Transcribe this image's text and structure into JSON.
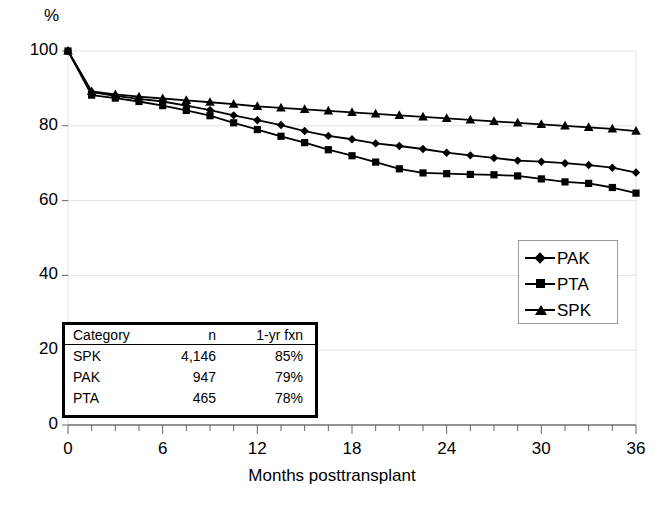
{
  "chart_data": {
    "type": "line",
    "title": "",
    "xlabel": "Months posttransplant",
    "ylabel": "%",
    "ylim": [
      0,
      100
    ],
    "xlim": [
      0,
      36
    ],
    "yticks": [
      0,
      20,
      40,
      60,
      80,
      100
    ],
    "xticks": [
      0,
      6,
      12,
      18,
      24,
      30,
      36
    ],
    "grid": "horizontal",
    "legend_position": "right-middle",
    "x": [
      0,
      1.5,
      3,
      4.5,
      6,
      7.5,
      9,
      10.5,
      12,
      13.5,
      15,
      16.5,
      18,
      19.5,
      21,
      22.5,
      24,
      25.5,
      27,
      28.5,
      30,
      31.5,
      33,
      34.5,
      36
    ],
    "series": [
      {
        "name": "PAK",
        "marker": "diamond",
        "values": [
          100,
          89,
          88,
          87.2,
          86.5,
          85.4,
          84.2,
          82.8,
          81.5,
          80.2,
          78.6,
          77.3,
          76.4,
          75.3,
          74.6,
          73.8,
          72.8,
          72.1,
          71.4,
          70.7,
          70.4,
          70.0,
          69.5,
          68.8,
          67.5
        ]
      },
      {
        "name": "PTA",
        "marker": "square",
        "values": [
          100,
          88.2,
          87.4,
          86.5,
          85.4,
          84.1,
          82.7,
          80.8,
          79.0,
          77.2,
          75.5,
          73.6,
          72.0,
          70.3,
          68.5,
          67.4,
          67.2,
          67.0,
          66.9,
          66.6,
          65.8,
          65.0,
          64.6,
          63.5,
          62.0
        ]
      },
      {
        "name": "SPK",
        "marker": "triangle",
        "values": [
          100,
          89.2,
          88.4,
          87.8,
          87.3,
          86.8,
          86.3,
          85.8,
          85.2,
          84.8,
          84.4,
          84.0,
          83.6,
          83.2,
          82.8,
          82.4,
          82.0,
          81.6,
          81.2,
          80.8,
          80.4,
          80.0,
          79.6,
          79.2,
          78.6
        ]
      }
    ]
  },
  "axes": {
    "unit_label": "%",
    "x_title": "Months posttransplant",
    "y_tick_labels": [
      "0",
      "20",
      "40",
      "60",
      "80",
      "100"
    ],
    "x_tick_labels": [
      "0",
      "6",
      "12",
      "18",
      "24",
      "30",
      "36"
    ]
  },
  "legend": {
    "items": [
      {
        "label": "PAK",
        "marker": "diamond"
      },
      {
        "label": "PTA",
        "marker": "square"
      },
      {
        "label": "SPK",
        "marker": "triangle"
      }
    ]
  },
  "data_table": {
    "headers": [
      "Category",
      "n",
      "1-yr fxn"
    ],
    "rows": [
      {
        "category": "SPK",
        "n": "4,146",
        "fxn": "85%"
      },
      {
        "category": "PAK",
        "n": "947",
        "fxn": "79%"
      },
      {
        "category": "PTA",
        "n": "465",
        "fxn": "78%"
      }
    ]
  },
  "colors": {
    "line": "#000000",
    "grid": "#e2e2e2",
    "axis": "#808080",
    "legend_border": "#9a9a9a",
    "table_border": "#000000",
    "background": "#ffffff"
  }
}
